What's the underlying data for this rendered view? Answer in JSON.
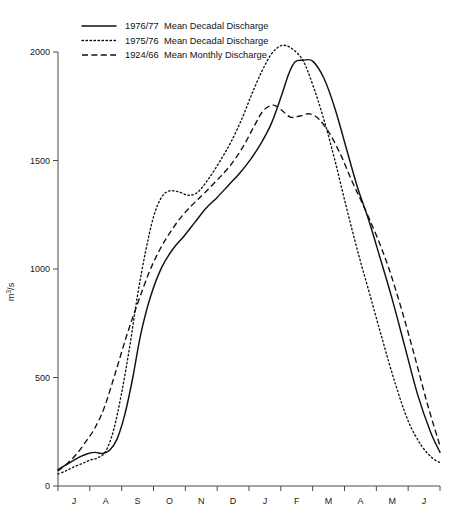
{
  "chart_data": {
    "type": "line",
    "title": "",
    "subtitle": "",
    "xlabel": "",
    "ylabel": "m³/s",
    "ylabel_parts": {
      "base": "m",
      "sup": "3",
      "tail": "/s"
    },
    "grid": false,
    "legend_position": "top-left",
    "xlim": [
      0,
      12
    ],
    "ylim": [
      0,
      2100
    ],
    "y_ticks": [
      0,
      500,
      1000,
      1500,
      2000
    ],
    "y_tick_labels": [
      "0",
      "500",
      "1000",
      "1500",
      "2000"
    ],
    "categories": [
      "J",
      "A",
      "S",
      "O",
      "N",
      "D",
      "J",
      "F",
      "M",
      "A",
      "M",
      "J"
    ],
    "x_tick_labels": [
      "J",
      "A",
      "S",
      "O",
      "N",
      "D",
      "J",
      "F",
      "M",
      "A",
      "M",
      "J"
    ],
    "x_axis_note": "Hydrological year, July through June",
    "series": [
      {
        "name": "1976/77  Mean Decadal Discharge",
        "label_year": "1976/77",
        "label_desc": "Mean Decadal Discharge",
        "style": "solid",
        "color": "#111111",
        "x": [
          0.0,
          0.22,
          0.45,
          0.7,
          0.95,
          1.18,
          1.4,
          1.62,
          1.85,
          2.1,
          2.35,
          2.6,
          2.9,
          3.25,
          3.6,
          3.95,
          4.3,
          4.65,
          5.0,
          5.35,
          5.7,
          6.05,
          6.4,
          6.7,
          7.0,
          7.25,
          7.45,
          7.7,
          8.0,
          8.35,
          8.7,
          9.05,
          9.4,
          9.75,
          10.1,
          10.5,
          10.9,
          11.3,
          11.7,
          12.0
        ],
        "y": [
          75,
          95,
          115,
          135,
          150,
          155,
          150,
          165,
          215,
          330,
          500,
          700,
          870,
          1005,
          1090,
          1150,
          1215,
          1280,
          1330,
          1385,
          1440,
          1505,
          1585,
          1670,
          1790,
          1900,
          1955,
          1962,
          1958,
          1880,
          1740,
          1560,
          1380,
          1230,
          1060,
          860,
          640,
          420,
          250,
          155
        ]
      },
      {
        "name": "1975/76  Mean Decadal Discharge",
        "label_year": "1975/76",
        "label_desc": "Mean Decadal Discharge",
        "style": "dotted",
        "color": "#111111",
        "x": [
          0.0,
          0.25,
          0.5,
          0.78,
          1.02,
          1.25,
          1.5,
          1.75,
          2.0,
          2.25,
          2.5,
          2.75,
          3.0,
          3.25,
          3.5,
          3.8,
          4.1,
          4.4,
          4.75,
          5.1,
          5.45,
          5.8,
          6.1,
          6.4,
          6.7,
          6.95,
          7.15,
          7.4,
          7.7,
          8.0,
          8.35,
          8.7,
          9.05,
          9.4,
          9.8,
          10.2,
          10.6,
          11.0,
          11.4,
          11.75,
          12.0
        ],
        "y": [
          55,
          70,
          88,
          105,
          120,
          130,
          160,
          260,
          430,
          640,
          880,
          1080,
          1240,
          1330,
          1360,
          1355,
          1340,
          1355,
          1420,
          1500,
          1590,
          1700,
          1810,
          1910,
          1990,
          2025,
          2030,
          2010,
          1960,
          1850,
          1690,
          1500,
          1290,
          1090,
          880,
          670,
          470,
          300,
          190,
          130,
          108
        ]
      },
      {
        "name": "1924/66  Mean Monthly Discharge",
        "label_year": "1924/66",
        "label_desc": "Mean Monthly Discharge",
        "style": "dashed",
        "color": "#111111",
        "x": [
          0.0,
          0.3,
          0.6,
          0.9,
          1.15,
          1.45,
          1.8,
          2.15,
          2.5,
          2.85,
          3.2,
          3.55,
          3.9,
          4.25,
          4.6,
          5.0,
          5.4,
          5.8,
          6.15,
          6.45,
          6.75,
          7.0,
          7.3,
          7.6,
          7.9,
          8.2,
          8.55,
          8.9,
          9.25,
          9.6,
          10.0,
          10.4,
          10.8,
          11.2,
          11.6,
          12.0
        ],
        "y": [
          70,
          105,
          150,
          210,
          265,
          360,
          520,
          690,
          840,
          980,
          1090,
          1175,
          1245,
          1300,
          1350,
          1410,
          1475,
          1560,
          1655,
          1730,
          1755,
          1735,
          1700,
          1705,
          1715,
          1690,
          1620,
          1520,
          1400,
          1290,
          1155,
          1000,
          810,
          600,
          380,
          185
        ]
      }
    ]
  },
  "legend": {
    "entries": [
      {
        "year": "1976/77",
        "desc": "Mean Decadal Discharge",
        "style": "solid"
      },
      {
        "year": "1975/76",
        "desc": "Mean Decadal Discharge",
        "style": "dotted"
      },
      {
        "year": "1924/66",
        "desc": "Mean Monthly Discharge",
        "style": "dashed"
      }
    ]
  },
  "axes": {
    "y_label": "m³/s",
    "y_tick_labels": [
      "2000",
      "1500",
      "1000",
      "500",
      "0"
    ],
    "x_tick_labels": [
      "J",
      "A",
      "S",
      "O",
      "N",
      "D",
      "J",
      "F",
      "M",
      "A",
      "M",
      "J"
    ]
  }
}
